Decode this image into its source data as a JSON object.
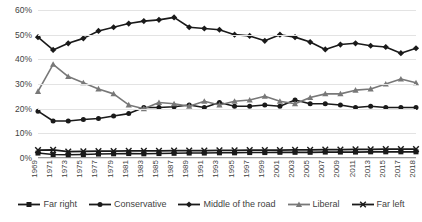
{
  "chart_data": {
    "type": "line",
    "title": "",
    "xlabel": "",
    "ylabel": "",
    "ylim": [
      0,
      60
    ],
    "ytick_labels": [
      "0%",
      "10%",
      "20%",
      "30%",
      "40%",
      "50%",
      "60%"
    ],
    "ytick_values": [
      0,
      10,
      20,
      30,
      40,
      50,
      60
    ],
    "grid": true,
    "legend_position": "bottom",
    "categories": [
      "1969",
      "1971",
      "1973",
      "1975",
      "1977",
      "1979",
      "1981",
      "1983",
      "1985",
      "1987",
      "1989",
      "1991",
      "1993",
      "1995",
      "1997",
      "1999",
      "2001",
      "2003",
      "2005",
      "2007",
      "2009",
      "2011",
      "2013",
      "2015",
      "2017",
      "2018"
    ],
    "series": [
      {
        "name": "Far right",
        "marker": "square",
        "color": "#1a1a1a",
        "values": [
          2.0,
          1.4,
          1.3,
          1.4,
          1.6,
          1.7,
          1.8,
          1.7,
          1.8,
          1.9,
          2.0,
          2.0,
          2.1,
          2.1,
          2.2,
          2.2,
          2.3,
          2.3,
          2.3,
          2.4,
          2.4,
          2.4,
          2.5,
          2.5,
          2.5,
          2.5
        ]
      },
      {
        "name": "Conservative",
        "marker": "circle",
        "color": "#1a1a1a",
        "values": [
          19.0,
          15.0,
          15.0,
          15.6,
          16.0,
          17.0,
          18.0,
          20.5,
          20.5,
          20.8,
          21.5,
          20.5,
          22.5,
          21.0,
          21.0,
          21.5,
          21.0,
          23.5,
          22.0,
          22.0,
          21.5,
          20.5,
          21.0,
          20.5,
          20.5,
          20.5
        ]
      },
      {
        "name": "Middle of the road",
        "marker": "diamond",
        "color": "#1a1a1a",
        "values": [
          49.0,
          43.8,
          46.5,
          48.5,
          51.5,
          53.0,
          54.5,
          55.5,
          56.0,
          57.0,
          53.0,
          52.5,
          52.0,
          50.0,
          49.5,
          47.5,
          50.0,
          49.0,
          47.0,
          44.0,
          46.0,
          46.5,
          45.5,
          45.0,
          42.5,
          44.5
        ]
      },
      {
        "name": "Liberal",
        "marker": "triangle",
        "color": "#787878",
        "values": [
          27.0,
          38.0,
          33.0,
          30.5,
          28.0,
          26.0,
          21.5,
          20.0,
          22.5,
          22.0,
          21.0,
          23.0,
          21.5,
          23.0,
          23.5,
          25.0,
          23.0,
          22.0,
          24.5,
          26.0,
          26.0,
          27.5,
          28.0,
          30.0,
          32.0,
          30.5
        ]
      },
      {
        "name": "Far left",
        "marker": "x",
        "color": "#1a1a1a",
        "values": [
          3.2,
          3.3,
          2.6,
          2.7,
          2.8,
          2.8,
          2.9,
          2.9,
          2.9,
          3.0,
          3.0,
          3.0,
          3.1,
          3.1,
          3.2,
          3.2,
          3.2,
          3.3,
          3.3,
          3.4,
          3.4,
          3.5,
          3.5,
          3.6,
          3.6,
          3.6
        ]
      }
    ]
  },
  "legend": {
    "items": [
      {
        "label": "Far right"
      },
      {
        "label": "Conservative"
      },
      {
        "label": "Middle of the road"
      },
      {
        "label": "Liberal"
      },
      {
        "label": "Far left"
      }
    ]
  }
}
